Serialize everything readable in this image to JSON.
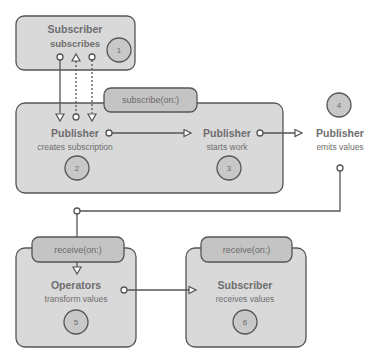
{
  "diagram": {
    "steps": [
      {
        "number": "1",
        "title": "Subscriber",
        "subtitle": "subscribes"
      },
      {
        "number": "2",
        "title": "Publisher",
        "subtitle": "creates subscription"
      },
      {
        "number": "3",
        "title": "Publisher",
        "subtitle": "starts work"
      },
      {
        "number": "4",
        "title": "Publisher",
        "subtitle": "emits values"
      },
      {
        "number": "5",
        "title": "Operators",
        "subtitle": "transform values"
      },
      {
        "number": "6",
        "title": "Subscriber",
        "subtitle": "receives values"
      }
    ],
    "tabs": {
      "subscribe": "subscribe(on:)",
      "receive_operators": "receive(on:)",
      "receive_subscriber": "receive(on:)"
    },
    "colors": {
      "box_fill": "#d9d9d9",
      "tab_fill": "#c4c4c4",
      "stroke": "#555555",
      "text": "#6e6e6e"
    }
  }
}
